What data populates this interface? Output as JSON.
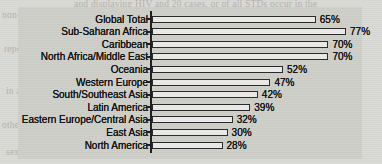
{
  "chart_data": {
    "type": "bar",
    "orientation": "horizontal",
    "title": "",
    "xlabel": "",
    "ylabel": "",
    "xlim": [
      0,
      80
    ],
    "grid": false,
    "legend": null,
    "categories": [
      "Global Total",
      "Sub-Saharan Africa",
      "Caribbean",
      "North Africa/Middle East",
      "Oceania",
      "Western Europe",
      "South/Southeast Asia",
      "Latin America",
      "Eastern Europe/Central Asia",
      "East Asia",
      "North America"
    ],
    "values": [
      65,
      77,
      70,
      70,
      52,
      47,
      42,
      39,
      32,
      30,
      28
    ],
    "value_labels": [
      "65%",
      "77%",
      "70%",
      "70%",
      "52%",
      "47%",
      "42%",
      "39%",
      "32%",
      "30%",
      "28%"
    ]
  },
  "style": {
    "page_background": "#d9d9d5",
    "panel_background": "#cfcfca",
    "bar_fill": "#eceae6",
    "bar_outline": "#2a2a2a",
    "text_color": "#141414",
    "axis_color": "#1e1e1e"
  },
  "background_text": {
    "line1": "and displaying    HIV and 20 cases, or of all STDs occur in the",
    "line2": "non-contraceptive use",
    "line3": "report additional",
    "line4": "in a decrease in the",
    "line5": "other adults and",
    "line6": "sexually active young women",
    "line7": "prevalence",
    "line8": "higher among"
  }
}
